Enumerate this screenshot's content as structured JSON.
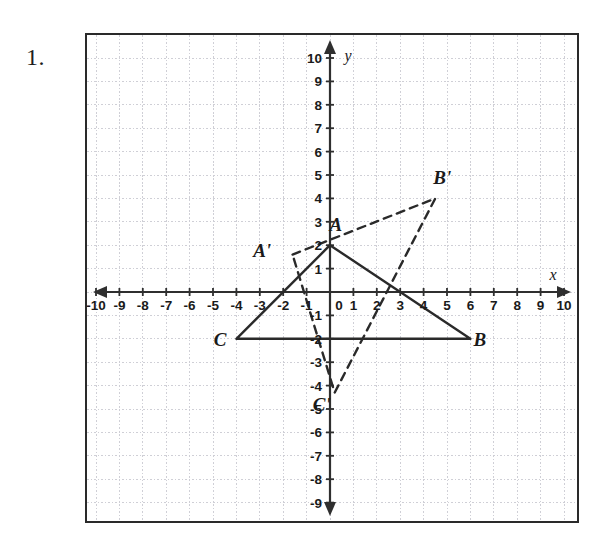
{
  "problem": {
    "number": "1."
  },
  "graph": {
    "axis_labels": {
      "x": "x",
      "y": "y"
    },
    "x_ticks": [
      "-10",
      "-9",
      "-8",
      "-7",
      "-6",
      "-5",
      "-4",
      "-3",
      "-2",
      "-1",
      "0",
      "1",
      "2",
      "3",
      "4",
      "5",
      "6",
      "7",
      "8",
      "9",
      "10"
    ],
    "y_ticks": [
      "10",
      "9",
      "8",
      "7",
      "6",
      "5",
      "4",
      "3",
      "2",
      "1",
      "-1",
      "-2",
      "-3",
      "-4",
      "-5",
      "-6",
      "-7",
      "-8",
      "-9",
      "-10"
    ],
    "origin_label": "0",
    "colors": {
      "grid": "#cfcfd6",
      "axis": "#2f2f2f",
      "frame": "#2a2a2a",
      "solid_shape": "#2a2a2a",
      "dashed_shape": "#2a2a2a",
      "text": "#1a1a1a"
    }
  },
  "chart_data": {
    "type": "scatter",
    "title": "",
    "xlabel": "x",
    "ylabel": "y",
    "xlim": [
      -10.5,
      10.5
    ],
    "ylim": [
      -10.5,
      10.5
    ],
    "xticks": [
      -10,
      -9,
      -8,
      -7,
      -6,
      -5,
      -4,
      -3,
      -2,
      -1,
      0,
      1,
      2,
      3,
      4,
      5,
      6,
      7,
      8,
      9,
      10
    ],
    "yticks": [
      -10,
      -9,
      -8,
      -7,
      -6,
      -5,
      -4,
      -3,
      -2,
      -1,
      1,
      2,
      3,
      4,
      5,
      6,
      7,
      8,
      9,
      10
    ],
    "grid": true,
    "legend": null,
    "series": [
      {
        "name": "Triangle ABC",
        "style": "solid",
        "closed": true,
        "points": [
          {
            "label": "A",
            "x": 0,
            "y": 2
          },
          {
            "label": "B",
            "x": 6,
            "y": -2
          },
          {
            "label": "C",
            "x": -4,
            "y": -2
          }
        ]
      },
      {
        "name": "Triangle A'B'C'",
        "style": "dashed",
        "closed": true,
        "points": [
          {
            "label": "A'",
            "x": -1.6,
            "y": 1.6
          },
          {
            "label": "B'",
            "x": 4.5,
            "y": 4
          },
          {
            "label": "C'",
            "x": 0.2,
            "y": -4.3
          }
        ]
      }
    ],
    "annotations": [
      {
        "text": "A",
        "x": 0.25,
        "y": 2.6,
        "style": "bold-italic"
      },
      {
        "text": "B",
        "x": 6.4,
        "y": -2.3,
        "style": "bold-italic"
      },
      {
        "text": "C",
        "x": -4.7,
        "y": -2.3,
        "style": "bold-italic"
      },
      {
        "text": "A'",
        "x": -2.9,
        "y": 1.5,
        "style": "bold-italic"
      },
      {
        "text": "B'",
        "x": 4.8,
        "y": 4.6,
        "style": "bold-italic"
      },
      {
        "text": "C'",
        "x": -0.35,
        "y": -5.1,
        "style": "bold-italic"
      }
    ]
  },
  "point_labels": {
    "a": "A",
    "b": "B",
    "c": "C",
    "a_prime": "A'",
    "b_prime": "B'",
    "c_prime": "C'"
  }
}
